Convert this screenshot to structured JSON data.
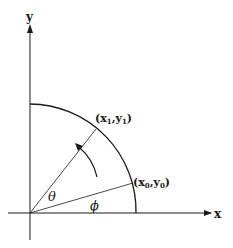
{
  "diagram": {
    "axes": {
      "x_label": "x",
      "y_label": "y"
    },
    "points": {
      "p0": {
        "label_pre": "(x",
        "sub": "0",
        "mid": ",y",
        "sub2": "0",
        "post": ")"
      },
      "p1": {
        "label_pre": "(x",
        "sub": "1",
        "mid": ",y",
        "sub2": "1",
        "post": ")"
      }
    },
    "angles": {
      "theta": "θ",
      "phi": "ϕ"
    },
    "colors": {
      "stroke": "#1a1a1a",
      "background": "#ffffff"
    }
  }
}
